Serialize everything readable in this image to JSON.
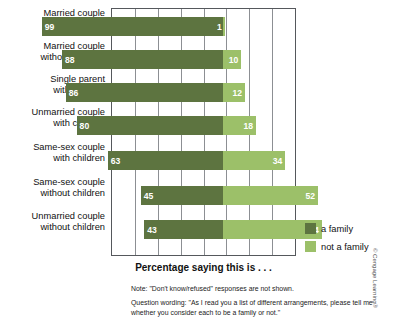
{
  "chart_data": {
    "type": "bar",
    "subtype": "stacked-horizontal-diverging",
    "title": "Percentage saying this is . . .",
    "xlabel": "Percentage saying this is . . .",
    "ylabel": "",
    "xlim": [
      0,
      100
    ],
    "grid": true,
    "legend_position": "right",
    "categories": [
      "Married couple\nwith children",
      "Married couple\nwithout children",
      "Single parent\nwith children",
      "Unmarried couple\nwith children",
      "Same-sex couple\nwith children",
      "Same-sex couple\nwithout children",
      "Unmarried couple\nwithout children"
    ],
    "series": [
      {
        "name": "a family",
        "color": "#5d7440",
        "values": [
          99,
          88,
          86,
          80,
          63,
          45,
          43
        ]
      },
      {
        "name": "not a family",
        "color": "#9cc069",
        "values": [
          1,
          10,
          12,
          18,
          34,
          52,
          54
        ]
      }
    ],
    "annotations": [
      "Note: \"Don't know/refused\" responses are not shown.",
      "Question wording: \"As I read you a list of different arrangements, please tell me whether you consider each to be a family or not.\""
    ]
  },
  "categories": [
    {
      "line1": "Married couple",
      "line2": "with children"
    },
    {
      "line1": "Married couple",
      "line2": "without children"
    },
    {
      "line1": "Single parent",
      "line2": "with children"
    },
    {
      "line1": "Unmarried couple",
      "line2": "with children"
    },
    {
      "line1": "Same-sex couple",
      "line2": "with children"
    },
    {
      "line1": "Same-sex couple",
      "line2": "without children"
    },
    {
      "line1": "Unmarried couple",
      "line2": "without children"
    }
  ],
  "bars": [
    {
      "family": "99",
      "not_family": "1"
    },
    {
      "family": "88",
      "not_family": "10"
    },
    {
      "family": "86",
      "not_family": "12"
    },
    {
      "family": "80",
      "not_family": "18"
    },
    {
      "family": "63",
      "not_family": "34"
    },
    {
      "family": "45",
      "not_family": "52"
    },
    {
      "family": "43",
      "not_family": "54"
    }
  ],
  "legend": {
    "items": [
      {
        "label": "a family",
        "color": "#5d7440"
      },
      {
        "label": "not a family",
        "color": "#9cc069"
      }
    ]
  },
  "axis_title": "Percentage saying this is . . .",
  "notes": [
    "Note: \"Don't know/refused\" responses are not shown.",
    "Question wording: \"As I read you a list of different arrangements, please tell me whether you consider each to be a family or not.\""
  ],
  "credit": "© Cengage Learning®",
  "colors": {
    "dark_green": "#5d7440",
    "light_green": "#9cc069",
    "plot_border": "#55585c",
    "gridline": "#8c8f93"
  }
}
